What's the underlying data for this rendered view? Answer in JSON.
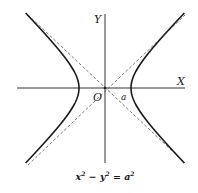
{
  "diagram": {
    "axes": {
      "x_label": "X",
      "y_label": "Y",
      "origin_label": "O"
    },
    "vertex_label": "a",
    "equation": {
      "lhs_x": "x",
      "exp1": "2",
      "minus": " − ",
      "lhs_y": "y",
      "exp2": "2",
      "equals": " = ",
      "rhs_a": "a",
      "exp3": "2"
    },
    "colors": {
      "curve": "#1a1a1a",
      "axis": "#333333",
      "asymptote": "#555555",
      "background": "#ffffff"
    },
    "geometry": {
      "origin": [
        105,
        88
      ],
      "a_px": 26,
      "extent": 75
    }
  }
}
